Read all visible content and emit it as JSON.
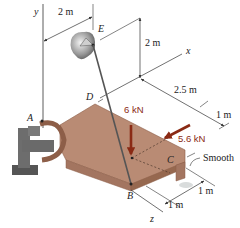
{
  "diagram": {
    "points": {
      "A": "A",
      "B": "B",
      "C": "C",
      "D": "D",
      "E": "E"
    },
    "axes": {
      "x": "x",
      "y": "y",
      "z": "z"
    },
    "dimensions": {
      "top_horizontal": "2 m",
      "vertical_E": "2 m",
      "x_span": "2.5 m",
      "x_end": "1 m",
      "z_upper": "1 m",
      "z_lower": "1 m"
    },
    "forces": {
      "vertical": "6 kN",
      "angled": "5.6 kN"
    },
    "notes": {
      "support": "Smooth"
    },
    "colors": {
      "plate": "#b98b74",
      "plate_edge": "#8d5e48",
      "plate_side": "#a37560",
      "force_arrow": "#8a2a14",
      "cable": "#555555",
      "lines": "#333333"
    }
  }
}
